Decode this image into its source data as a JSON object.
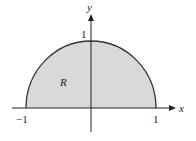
{
  "diagram": {
    "region_label": "R",
    "axes": {
      "x_label": "x",
      "y_label": "y",
      "x_ticks": [
        "−1",
        "1"
      ],
      "y_ticks": [
        "1"
      ]
    },
    "colors": {
      "region_fill": "#d9d9d9",
      "curve": "#333333",
      "axis": "#222222"
    }
  }
}
